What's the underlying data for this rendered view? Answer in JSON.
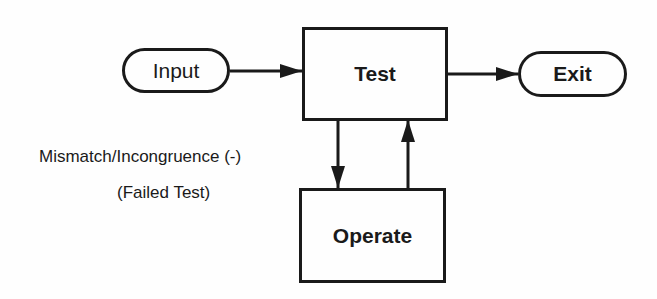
{
  "diagram": {
    "nodes": {
      "input": {
        "label": "Input",
        "shape": "oval"
      },
      "test": {
        "label": "Test",
        "shape": "rectangle"
      },
      "exit": {
        "label": "Exit",
        "shape": "oval"
      },
      "operate": {
        "label": "Operate",
        "shape": "rectangle"
      }
    },
    "edges": [
      {
        "from": "Input",
        "to": "Test"
      },
      {
        "from": "Test",
        "to": "Exit"
      },
      {
        "from": "Test",
        "to": "Operate"
      },
      {
        "from": "Operate",
        "to": "Test"
      }
    ],
    "annotations": {
      "mismatch": "Mismatch/Incongruence (-)",
      "failed": "(Failed Test)"
    },
    "colors": {
      "stroke": "#1a1a1a",
      "background": "#fefefe"
    }
  }
}
